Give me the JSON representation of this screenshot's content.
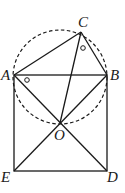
{
  "diagram": {
    "points": {
      "A": {
        "label": "A",
        "x": 14,
        "y": 75
      },
      "B": {
        "label": "B",
        "x": 107,
        "y": 75
      },
      "C": {
        "label": "C",
        "x": 81,
        "y": 32
      },
      "O": {
        "label": "O",
        "x": 60,
        "y": 123
      },
      "E": {
        "label": "E",
        "x": 14,
        "y": 171
      },
      "D": {
        "label": "D",
        "x": 107,
        "y": 171
      }
    },
    "segments": [
      "AB",
      "BD",
      "DE",
      "EA",
      "AC",
      "CB",
      "CO",
      "AD",
      "BE"
    ],
    "circle": {
      "cx": 60,
      "cy": 77,
      "r": 47,
      "style": "dashed"
    },
    "angle_marks": [
      {
        "at": "C",
        "symbol": "o"
      },
      {
        "at": "A",
        "symbol": "o"
      }
    ]
  }
}
